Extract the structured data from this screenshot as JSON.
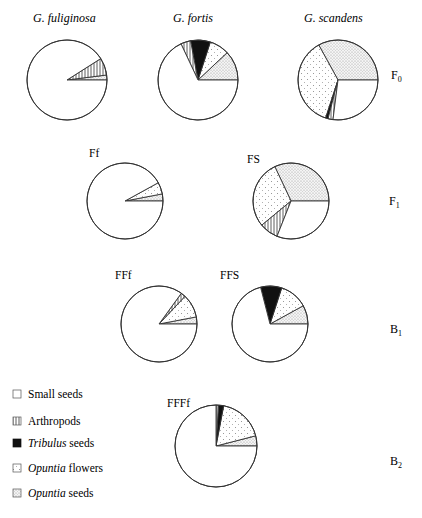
{
  "chart_data": {
    "type": "pie",
    "title": "",
    "legend": [
      {
        "key": "small_seeds",
        "label": "Small seeds",
        "italic_part": "",
        "pattern": "white"
      },
      {
        "key": "arthropods",
        "label": "Arthropods",
        "italic_part": "",
        "pattern": "vertical-hatch"
      },
      {
        "key": "tribulus_seeds",
        "label": " seeds",
        "italic_part": "Tribulus",
        "pattern": "black"
      },
      {
        "key": "opuntia_flowers",
        "label": " flowers",
        "italic_part": "Opuntia",
        "pattern": "sparse-dots"
      },
      {
        "key": "opuntia_seeds",
        "label": " seeds",
        "italic_part": "Opuntia",
        "pattern": "dense-dots"
      }
    ],
    "rows": [
      {
        "label": "F",
        "sub": "0"
      },
      {
        "label": "F",
        "sub": "1"
      },
      {
        "label": "B",
        "sub": "1"
      },
      {
        "label": "B",
        "sub": "2"
      }
    ],
    "pies": [
      {
        "name": "G. fuliginosa",
        "italic": true,
        "row": "F0",
        "cx": 67,
        "cy": 80,
        "r": 40,
        "slices": [
          {
            "category": "opuntia_seeds",
            "percent": 2
          },
          {
            "category": "arthropods",
            "percent": 7
          },
          {
            "category": "small_seeds",
            "percent": 91
          }
        ]
      },
      {
        "name": "G. fortis",
        "italic": true,
        "row": "F0",
        "cx": 198,
        "cy": 80,
        "r": 40,
        "slices": [
          {
            "category": "opuntia_seeds",
            "percent": 12
          },
          {
            "category": "opuntia_flowers",
            "percent": 8
          },
          {
            "category": "tribulus_seeds",
            "percent": 8
          },
          {
            "category": "arthropods",
            "percent": 4
          },
          {
            "category": "small_seeds",
            "percent": 68
          }
        ]
      },
      {
        "name": "G. scandens",
        "italic": true,
        "row": "F0",
        "cx": 338,
        "cy": 80,
        "r": 40,
        "slices": [
          {
            "category": "opuntia_seeds",
            "percent": 33
          },
          {
            "category": "opuntia_flowers",
            "percent": 37
          },
          {
            "category": "tribulus_seeds",
            "percent": 1
          },
          {
            "category": "arthropods",
            "percent": 2
          },
          {
            "category": "small_seeds",
            "percent": 27
          }
        ]
      },
      {
        "name": "Ff",
        "italic": false,
        "row": "F1",
        "cx": 125,
        "cy": 201,
        "r": 38,
        "slices": [
          {
            "category": "opuntia_seeds",
            "percent": 3
          },
          {
            "category": "opuntia_flowers",
            "percent": 5
          },
          {
            "category": "small_seeds",
            "percent": 92
          }
        ]
      },
      {
        "name": "FS",
        "italic": false,
        "row": "F1",
        "cx": 291,
        "cy": 201,
        "r": 38,
        "slices": [
          {
            "category": "opuntia_seeds",
            "percent": 32
          },
          {
            "category": "opuntia_flowers",
            "percent": 29
          },
          {
            "category": "arthropods",
            "percent": 8
          },
          {
            "category": "small_seeds",
            "percent": 31
          }
        ]
      },
      {
        "name": "FFf",
        "italic": false,
        "row": "B1",
        "cx": 159,
        "cy": 324,
        "r": 38,
        "slices": [
          {
            "category": "opuntia_seeds",
            "percent": 3
          },
          {
            "category": "opuntia_flowers",
            "percent": 10
          },
          {
            "category": "arthropods",
            "percent": 2
          },
          {
            "category": "small_seeds",
            "percent": 85
          }
        ]
      },
      {
        "name": "FFS",
        "italic": false,
        "row": "B1",
        "cx": 270,
        "cy": 324,
        "r": 38,
        "slices": [
          {
            "category": "opuntia_seeds",
            "percent": 8
          },
          {
            "category": "opuntia_flowers",
            "percent": 12
          },
          {
            "category": "tribulus_seeds",
            "percent": 9
          },
          {
            "category": "small_seeds",
            "percent": 71
          }
        ]
      },
      {
        "name": "FFFf",
        "italic": false,
        "row": "B2",
        "cx": 216,
        "cy": 446,
        "r": 41,
        "slices": [
          {
            "category": "opuntia_seeds",
            "percent": 4
          },
          {
            "category": "opuntia_flowers",
            "percent": 18
          },
          {
            "category": "tribulus_seeds",
            "percent": 2
          },
          {
            "category": "arthropods",
            "percent": 1
          },
          {
            "category": "small_seeds",
            "percent": 75
          }
        ]
      }
    ],
    "start_angle_deg": 0,
    "direction": "counterclockwise"
  },
  "labels": {
    "title_fuliginosa": "G. fuliginosa",
    "title_fortis": "G. fortis",
    "title_scandens": "G. scandens",
    "label_ff": "Ff",
    "label_fs": "FS",
    "label_fff": "FFf",
    "label_ffs": "FFS",
    "label_ffff": "FFFf",
    "row_f0": "F",
    "row_f0_sub": "0",
    "row_f1": "F",
    "row_f1_sub": "1",
    "row_b1": "B",
    "row_b1_sub": "1",
    "row_b2": "B",
    "row_b2_sub": "2"
  },
  "legend_text": {
    "small_seeds": "Small seeds",
    "arthropods": "Arthropods",
    "tribulus_italic": "Tribulus",
    "tribulus_rest": " seeds",
    "opuntia_flowers_italic": "Opuntia",
    "opuntia_flowers_rest": " flowers",
    "opuntia_seeds_italic": "Opuntia",
    "opuntia_seeds_rest": " seeds"
  }
}
